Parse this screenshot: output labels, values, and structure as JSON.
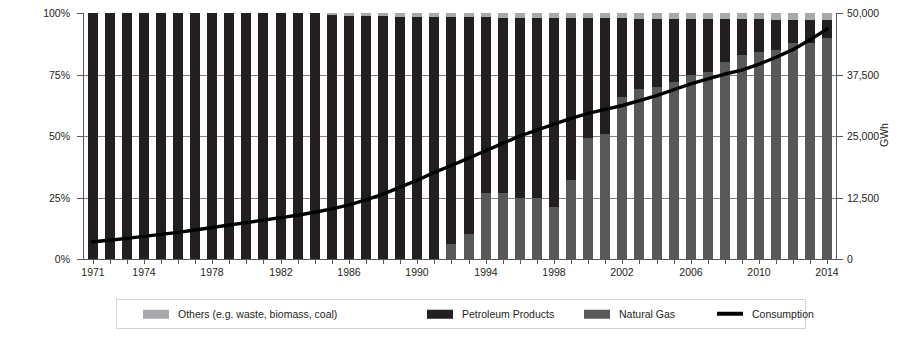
{
  "chart_data": {
    "type": "bar",
    "title": "",
    "subtitle": "",
    "xlabel": "",
    "ylabel": "Proportion",
    "y2label": "GWh",
    "grid": true,
    "legend_position": "bottom",
    "ylim": [
      0,
      100
    ],
    "y2lim": [
      0,
      50000
    ],
    "y_ticklabels": [
      "100%",
      "75%",
      "50%",
      "25%",
      "0%"
    ],
    "y_tickvalues": [
      100,
      75,
      50,
      25,
      0
    ],
    "y2_ticklabels": [
      "50,000",
      "37,500",
      "25,000",
      "12,500",
      "0"
    ],
    "y2_tickvalues": [
      50000,
      37500,
      25000,
      12500,
      0
    ],
    "x_ticklabels": [
      "1971",
      "1974",
      "1978",
      "1982",
      "1986",
      "1990",
      "1994",
      "1998",
      "2002",
      "2006",
      "2010",
      "2014"
    ],
    "categories": [
      "1971",
      "1972",
      "1973",
      "1974",
      "1975",
      "1976",
      "1977",
      "1978",
      "1979",
      "1980",
      "1981",
      "1982",
      "1983",
      "1984",
      "1985",
      "1986",
      "1987",
      "1988",
      "1989",
      "1990",
      "1991",
      "1992",
      "1993",
      "1994",
      "1995",
      "1996",
      "1997",
      "1998",
      "1999",
      "2000",
      "2001",
      "2002",
      "2003",
      "2004",
      "2005",
      "2006",
      "2007",
      "2008",
      "2009",
      "2010",
      "2011",
      "2012",
      "2013",
      "2014"
    ],
    "series": [
      {
        "name": "Others (e.g. waste, biomass, coal)",
        "color": "#a7a9ac",
        "values": [
          0,
          0,
          0,
          0,
          0,
          0,
          0,
          0,
          0,
          0,
          0,
          0,
          0,
          0,
          1.0,
          1.2,
          1.3,
          1.4,
          1.5,
          1.6,
          1.6,
          1.7,
          1.8,
          1.8,
          1.9,
          1.9,
          2.0,
          2.0,
          2.1,
          2.1,
          2.2,
          2.2,
          2.3,
          2.3,
          2.4,
          2.4,
          2.5,
          2.5,
          2.6,
          2.6,
          2.7,
          2.8,
          2.9,
          3.0
        ]
      },
      {
        "name": "Petroleum Products",
        "color": "#231f20",
        "values": [
          100,
          100,
          100,
          100,
          100,
          100,
          100,
          100,
          100,
          100,
          100,
          100,
          100,
          100,
          99.0,
          98.8,
          98.7,
          98.6,
          98.5,
          98.4,
          98.4,
          92.3,
          88.2,
          71.2,
          71.1,
          73.1,
          73.0,
          77.0,
          65.9,
          48.9,
          46.8,
          31.8,
          28.7,
          27.7,
          25.6,
          22.6,
          21.5,
          17.4,
          14.4,
          13.3,
          12.3,
          9.2,
          9.1,
          7.0
        ]
      },
      {
        "name": "Natural Gas",
        "color": "#58595b",
        "values": [
          0,
          0,
          0,
          0,
          0,
          0,
          0,
          0,
          0,
          0,
          0,
          0,
          0,
          0,
          0,
          0,
          0,
          0,
          0,
          0,
          0,
          6.0,
          10.0,
          27.0,
          27.0,
          25.0,
          25.0,
          21.0,
          32.0,
          49.0,
          51.0,
          66.0,
          69.0,
          70.0,
          72.0,
          75.0,
          76.0,
          80.1,
          83.0,
          84.1,
          85.0,
          88.0,
          88.0,
          90.0
        ]
      }
    ],
    "line_series": {
      "name": "Consumption",
      "color": "#000000",
      "unit": "GWh",
      "values": [
        3500,
        3800,
        4200,
        4600,
        5000,
        5400,
        5900,
        6400,
        6900,
        7400,
        7900,
        8400,
        8900,
        9500,
        10200,
        11000,
        12000,
        13200,
        14600,
        16000,
        17600,
        19000,
        20500,
        22000,
        23500,
        25000,
        26200,
        27400,
        28600,
        29600,
        30400,
        31200,
        32200,
        33200,
        34400,
        35600,
        36600,
        37600,
        38400,
        39600,
        41000,
        42600,
        44600,
        46800
      ]
    }
  },
  "legend": {
    "items": [
      {
        "label": "Others (e.g. waste, biomass, coal)",
        "type": "swatch",
        "color": "#a7a9ac"
      },
      {
        "label": "Petroleum Products",
        "type": "swatch",
        "color": "#231f20"
      },
      {
        "label": "Natural Gas",
        "type": "swatch",
        "color": "#58595b"
      },
      {
        "label": "Consumption",
        "type": "line",
        "color": "#000000"
      }
    ]
  }
}
